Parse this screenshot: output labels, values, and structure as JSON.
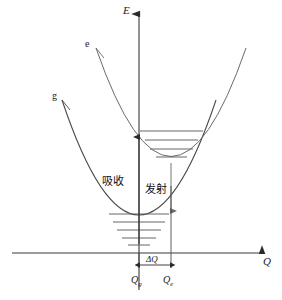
{
  "diagram": {
    "axes": {
      "y_label": "E",
      "x_label": "Q"
    },
    "curves": [
      {
        "id": "excited",
        "label": "e",
        "name": "excited-state-parabola"
      },
      {
        "id": "ground",
        "label": "g",
        "name": "ground-state-parabola"
      }
    ],
    "transitions": [
      {
        "id": "absorption",
        "label": "吸收",
        "direction": "up"
      },
      {
        "id": "emission",
        "label": "发射",
        "direction": "down"
      }
    ],
    "markers": {
      "delta": "ΔQ",
      "q_ground": "Q",
      "q_ground_sub": "g",
      "q_excited": "Q",
      "q_excited_sub": "e"
    },
    "levels": {
      "ground_count": 5,
      "excited_count": 4
    },
    "colors": {
      "line": "#3a3a3a",
      "curve": "#4a4a4a",
      "level": "#555555",
      "text": "#1a1a1a",
      "background": "#ffffff"
    }
  }
}
